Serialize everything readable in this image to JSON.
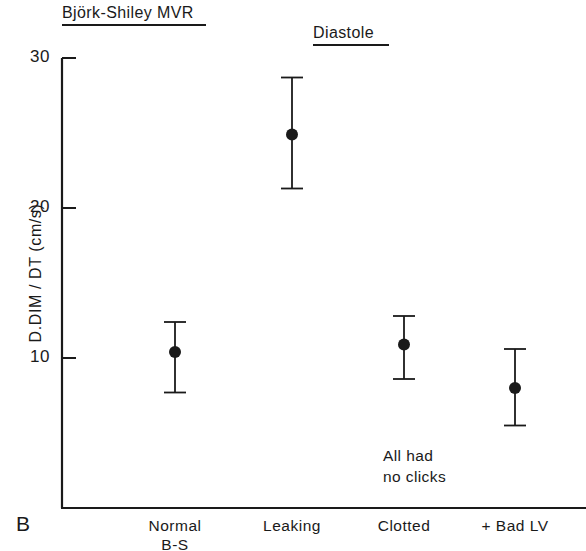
{
  "figure": {
    "panel_label": "B",
    "title_main": "Björk-Shiley MVR",
    "title_phase": "Diastole",
    "annotation": "All had\nno clicks"
  },
  "chart_data": {
    "type": "scatter",
    "title": "Björk-Shiley MVR",
    "subtitle": "Diastole",
    "xlabel": "",
    "ylabel": "D.DIM / DT  (cm/s)",
    "ylim": [
      0,
      30
    ],
    "yticks": [
      10,
      20,
      30
    ],
    "ytick_labels": [
      "10",
      "20",
      "30"
    ],
    "grid": false,
    "legend": null,
    "annotations": [
      "All had no clicks"
    ],
    "categories": [
      "Normal\nB-S",
      "Leaking",
      "Clotted",
      "+ Bad LV"
    ],
    "error_bar_style": "mean with capped range bars",
    "points": [
      {
        "category": "Normal\nB-S",
        "value": 10.4,
        "low": 7.7,
        "high": 12.4
      },
      {
        "category": "Leaking",
        "value": 24.9,
        "low": 21.3,
        "high": 28.7
      },
      {
        "category": "Clotted",
        "value": 10.9,
        "low": 8.6,
        "high": 12.8
      },
      {
        "category": "+ Bad LV",
        "value": 8.0,
        "low": 5.5,
        "high": 10.6
      }
    ],
    "values": [
      10.4,
      24.9,
      10.9,
      8.0
    ],
    "errors_low": [
      7.7,
      21.3,
      8.6,
      5.5
    ],
    "errors_high": [
      12.4,
      28.7,
      12.8,
      10.6
    ]
  },
  "style": {
    "ink": "#1a1a1a",
    "background": "#ffffff"
  }
}
